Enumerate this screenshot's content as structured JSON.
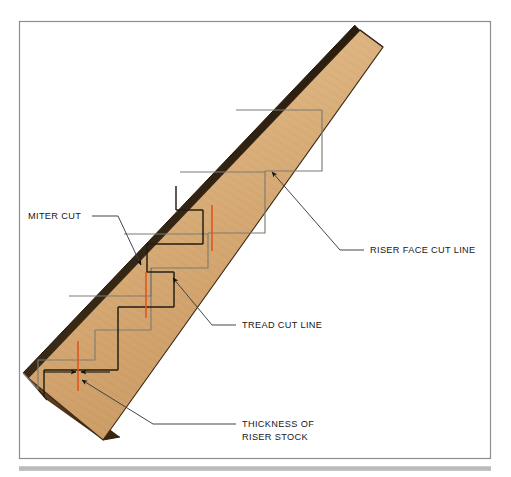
{
  "figure": {
    "kind": "technical-illustration",
    "background_color": "#ffffff",
    "frame_color": "#8d8d92",
    "footer_bar_color": "#b9b9bc"
  },
  "board": {
    "name": "riser stock board",
    "face_color_light": "#e8c69a",
    "face_color_dark": "#c79a62",
    "edge_color": "#3a2a17",
    "end_grain_color": "#5a3c1e"
  },
  "cut_lines": {
    "stair_step_layout_color": "#7d7d72",
    "tread_cut_color": "#211c12",
    "riser_thickness_color": "#e0561f"
  },
  "labels": [
    {
      "id": "miter-cut",
      "text": "MITER CUT",
      "x": 28,
      "y": 219
    },
    {
      "id": "riser-face-cut-line",
      "text": "RISER FACE CUT LINE",
      "x": 370,
      "y": 253
    },
    {
      "id": "tread-cut-line",
      "text": "TREAD CUT LINE",
      "x": 242,
      "y": 328
    },
    {
      "id": "thickness-of-riser-stock",
      "line1": "THICKNESS OF",
      "line2": "RISER STOCK",
      "x": 242,
      "y": 427
    }
  ]
}
